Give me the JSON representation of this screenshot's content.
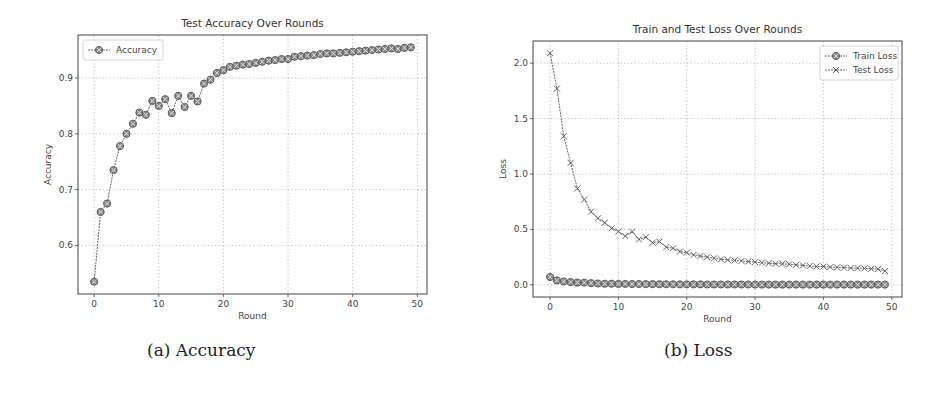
{
  "captions": {
    "a": "(a) Accuracy",
    "b": "(b) Loss"
  },
  "colors": {
    "line": "#555555",
    "marker_fill": "#888888",
    "grid": "#bbbbbb",
    "axis": "#444444"
  },
  "chart_data": [
    {
      "id": "accuracy",
      "type": "line",
      "title": "Test Accuracy Over Rounds",
      "xlabel": "Round",
      "ylabel": "Accuracy",
      "xlim": [
        -2.5,
        51.5
      ],
      "ylim": [
        0.513,
        0.977
      ],
      "xticks": [
        0,
        10,
        20,
        30,
        40,
        50
      ],
      "yticks": [
        0.6,
        0.7,
        0.8,
        0.9
      ],
      "ytick_labels": [
        "0.6",
        "0.7",
        "0.8",
        "0.9"
      ],
      "grid": true,
      "legend_position": "upper left",
      "x": [
        0,
        1,
        2,
        3,
        4,
        5,
        6,
        7,
        8,
        9,
        10,
        11,
        12,
        13,
        14,
        15,
        16,
        17,
        18,
        19,
        20,
        21,
        22,
        23,
        24,
        25,
        26,
        27,
        28,
        29,
        30,
        31,
        32,
        33,
        34,
        35,
        36,
        37,
        38,
        39,
        40,
        41,
        42,
        43,
        44,
        45,
        46,
        47,
        48,
        49
      ],
      "series": [
        {
          "name": "Accuracy",
          "marker": "x-circle",
          "values": [
            0.535,
            0.66,
            0.675,
            0.735,
            0.778,
            0.8,
            0.818,
            0.838,
            0.834,
            0.859,
            0.85,
            0.862,
            0.837,
            0.868,
            0.848,
            0.868,
            0.858,
            0.89,
            0.897,
            0.909,
            0.914,
            0.92,
            0.922,
            0.924,
            0.925,
            0.927,
            0.929,
            0.931,
            0.932,
            0.934,
            0.934,
            0.938,
            0.939,
            0.94,
            0.941,
            0.943,
            0.944,
            0.944,
            0.945,
            0.946,
            0.947,
            0.948,
            0.949,
            0.95,
            0.951,
            0.952,
            0.953,
            0.952,
            0.954,
            0.955
          ]
        }
      ]
    },
    {
      "id": "loss",
      "type": "line",
      "title": "Train and Test Loss Over Rounds",
      "xlabel": "Round",
      "ylabel": "Loss",
      "xlim": [
        -2.5,
        51.5
      ],
      "ylim": [
        -0.11,
        2.2
      ],
      "xticks": [
        0,
        10,
        20,
        30,
        40,
        50
      ],
      "yticks": [
        0.0,
        0.5,
        1.0,
        1.5,
        2.0
      ],
      "ytick_labels": [
        "0.0",
        "0.5",
        "1.0",
        "1.5",
        "2.0"
      ],
      "grid": true,
      "legend_position": "upper right",
      "x": [
        0,
        1,
        2,
        3,
        4,
        5,
        6,
        7,
        8,
        9,
        10,
        11,
        12,
        13,
        14,
        15,
        16,
        17,
        18,
        19,
        20,
        21,
        22,
        23,
        24,
        25,
        26,
        27,
        28,
        29,
        30,
        31,
        32,
        33,
        34,
        35,
        36,
        37,
        38,
        39,
        40,
        41,
        42,
        43,
        44,
        45,
        46,
        47,
        48,
        49
      ],
      "series": [
        {
          "name": "Train Loss",
          "marker": "x-circle",
          "values": [
            0.07,
            0.04,
            0.03,
            0.025,
            0.02,
            0.02,
            0.015,
            0.012,
            0.01,
            0.01,
            0.008,
            0.008,
            0.007,
            0.007,
            0.006,
            0.006,
            0.005,
            0.005,
            0.005,
            0.004,
            0.004,
            0.004,
            0.004,
            0.003,
            0.003,
            0.003,
            0.003,
            0.003,
            0.003,
            0.003,
            0.002,
            0.002,
            0.002,
            0.002,
            0.002,
            0.002,
            0.002,
            0.002,
            0.002,
            0.002,
            0.002,
            0.002,
            0.002,
            0.002,
            0.002,
            0.002,
            0.002,
            0.002,
            0.002,
            0.002
          ]
        },
        {
          "name": "Test Loss",
          "marker": "x",
          "values": [
            2.09,
            1.77,
            1.34,
            1.1,
            0.87,
            0.77,
            0.66,
            0.6,
            0.56,
            0.51,
            0.48,
            0.44,
            0.48,
            0.41,
            0.43,
            0.38,
            0.39,
            0.34,
            0.33,
            0.3,
            0.29,
            0.27,
            0.26,
            0.25,
            0.24,
            0.23,
            0.225,
            0.22,
            0.215,
            0.21,
            0.205,
            0.2,
            0.195,
            0.19,
            0.19,
            0.185,
            0.18,
            0.175,
            0.17,
            0.165,
            0.165,
            0.16,
            0.158,
            0.155,
            0.152,
            0.15,
            0.148,
            0.145,
            0.142,
            0.125
          ]
        }
      ]
    }
  ]
}
